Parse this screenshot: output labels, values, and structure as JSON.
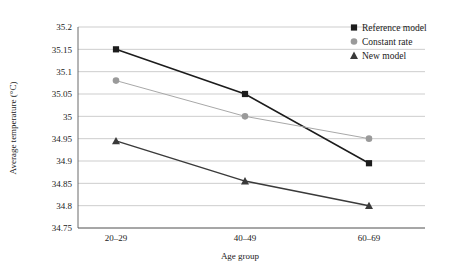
{
  "chart_data": {
    "type": "line",
    "title": "",
    "xlabel": "Age group",
    "ylabel": "Average temperature (°C)",
    "categories": [
      "20–29",
      "40–49",
      "60–69"
    ],
    "ylim": [
      34.75,
      35.2
    ],
    "yticks": [
      "34.75",
      "34.8",
      "34.85",
      "34.9",
      "34.95",
      "35",
      "35.05",
      "35.1",
      "35.15",
      "35.2"
    ],
    "ytick_values": [
      34.75,
      34.8,
      34.85,
      34.9,
      34.95,
      35.0,
      35.05,
      35.1,
      35.15,
      35.2
    ],
    "grid": true,
    "legend_position": "top-right",
    "series": [
      {
        "name": "Reference model",
        "marker": "square",
        "color": "#1c1c1c",
        "line_color": "#1c1c1c",
        "values": [
          35.15,
          35.05,
          34.895
        ]
      },
      {
        "name": "Constant rate",
        "marker": "circle",
        "color": "#9a9a9a",
        "line_color": "#a8a8a8",
        "values": [
          35.08,
          35.0,
          34.95
        ]
      },
      {
        "name": "New model",
        "marker": "triangle",
        "color": "#3a3a3a",
        "line_color": "#3a3a3a",
        "values": [
          34.945,
          34.855,
          34.8
        ]
      }
    ]
  },
  "legend": {
    "items": [
      {
        "label": "Reference model"
      },
      {
        "label": "Constant rate"
      },
      {
        "label": "New model"
      }
    ]
  },
  "axes": {
    "x_title": "Age group",
    "y_title": "Average temperature (°C)",
    "x_tick_0": "20–29",
    "x_tick_1": "40–49",
    "x_tick_2": "60–69",
    "y_tick_0": "34.75",
    "y_tick_1": "34.8",
    "y_tick_2": "34.85",
    "y_tick_3": "34.9",
    "y_tick_4": "34.95",
    "y_tick_5": "35",
    "y_tick_6": "35.05",
    "y_tick_7": "35.1",
    "y_tick_8": "35.15",
    "y_tick_9": "35.2"
  }
}
